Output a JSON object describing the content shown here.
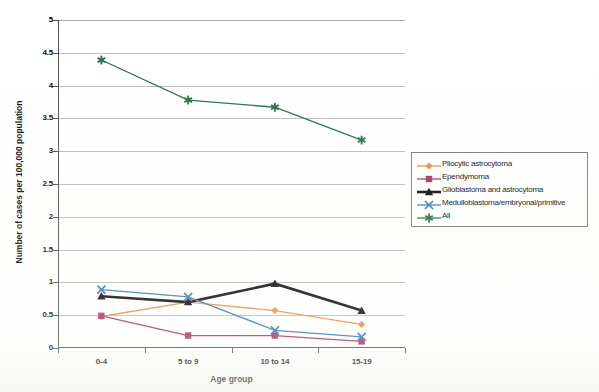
{
  "chart_data": {
    "type": "line",
    "title": "",
    "xlabel": "Age group",
    "ylabel": "Number of cases per 100,000 population",
    "categories": [
      "0-4",
      "5 to 9",
      "10 to 14",
      "15-19"
    ],
    "ylim": [
      0,
      5
    ],
    "ytick_labels": [
      "0",
      "0.5",
      "1",
      "1.5",
      "2",
      "2.5",
      "3",
      "3.5",
      "4",
      "4.5",
      "5"
    ],
    "ytick_values": [
      0,
      0.5,
      1,
      1.5,
      2,
      2.5,
      3,
      3.5,
      4,
      4.5,
      5
    ],
    "grid": true,
    "legend_position": "right",
    "series": [
      {
        "name": "Pilocytic astrocytoma",
        "values": [
          0.48,
          0.7,
          0.57,
          0.36
        ],
        "color": "#E8883A",
        "marker": "diamond"
      },
      {
        "name": "Ependymoma",
        "values": [
          0.49,
          0.19,
          0.19,
          0.1
        ],
        "color": "#A52A5A",
        "marker": "square"
      },
      {
        "name": "Glioblastoma and astrocytoma",
        "values": [
          0.79,
          0.7,
          0.98,
          0.57
        ],
        "color": "#000000",
        "marker": "triangle"
      },
      {
        "name": "Medulloblastoma/embryonal/primitive",
        "values": [
          0.89,
          0.78,
          0.27,
          0.17
        ],
        "color": "#2E6FBF",
        "marker": "cross"
      },
      {
        "name": "All",
        "values": [
          4.39,
          3.78,
          3.67,
          3.17
        ],
        "color": "#1D6B42",
        "marker": "asterisk"
      }
    ]
  },
  "legend": {
    "items": [
      {
        "label": "Pilocytic astrocytoma"
      },
      {
        "label": "Ependymoma"
      },
      {
        "label": "Glioblastoma and astrocytoma"
      },
      {
        "label": "Medulloblastoma/embryonal/primitive"
      },
      {
        "label": "All"
      }
    ]
  }
}
